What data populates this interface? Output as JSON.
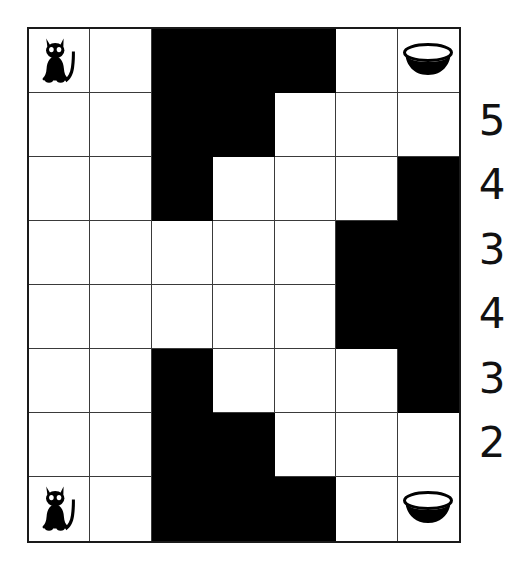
{
  "puzzle": {
    "title": "Cat Maze Grid Puzzle",
    "rows": 8,
    "cols": 7,
    "colors": {
      "wall": "#000000",
      "path": "#ffffff",
      "grid_line": "#3a3a3a",
      "border": "#1a1a1a",
      "number": "#111111"
    },
    "icons": {
      "cat": "cat-icon",
      "bowl": "bowl-icon"
    },
    "cells": [
      [
        "cat",
        "white",
        "black",
        "black",
        "black",
        "white",
        "bowl"
      ],
      [
        "white",
        "white",
        "black",
        "black",
        "white",
        "white",
        "white"
      ],
      [
        "white",
        "white",
        "black",
        "white",
        "white",
        "white",
        "black"
      ],
      [
        "white",
        "white",
        "white",
        "white",
        "white",
        "black",
        "black"
      ],
      [
        "white",
        "white",
        "white",
        "white",
        "white",
        "black",
        "black"
      ],
      [
        "white",
        "white",
        "black",
        "white",
        "white",
        "white",
        "black"
      ],
      [
        "white",
        "white",
        "black",
        "black",
        "white",
        "white",
        "white"
      ],
      [
        "cat",
        "white",
        "black",
        "black",
        "black",
        "white",
        "bowl"
      ]
    ],
    "row_clues": [
      {
        "row": 2,
        "value": "5"
      },
      {
        "row": 3,
        "value": "4"
      },
      {
        "row": 4,
        "value": "3"
      },
      {
        "row": 5,
        "value": "4"
      },
      {
        "row": 6,
        "value": "3"
      },
      {
        "row": 7,
        "value": "2"
      }
    ]
  }
}
